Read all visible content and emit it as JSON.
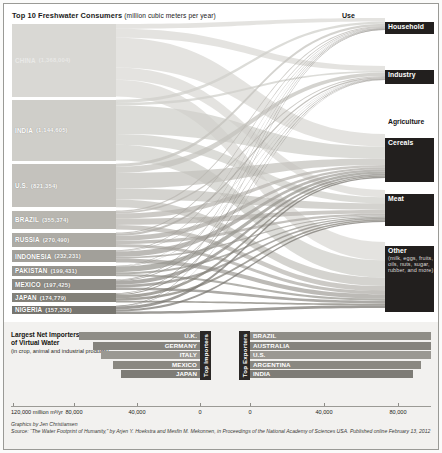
{
  "sankey": {
    "title": "Top 10 Freshwater Consumers",
    "title_units": "(million cubic meters per year)",
    "use_header": "Use",
    "countries": [
      {
        "name": "CHINA",
        "value": "(1,368,004)",
        "amount": 1368004
      },
      {
        "name": "INDIA",
        "value": "(1,144,605)",
        "amount": 1144605
      },
      {
        "name": "U.S.",
        "value": "(821,354)",
        "amount": 821354
      },
      {
        "name": "BRAZIL",
        "value": "(355,374)",
        "amount": 355374
      },
      {
        "name": "RUSSIA",
        "value": "(270,490)",
        "amount": 270490
      },
      {
        "name": "INDONESIA",
        "value": "(232,231)",
        "amount": 232231
      },
      {
        "name": "PAKISTAN",
        "value": "(199,431)",
        "amount": 199431
      },
      {
        "name": "MEXICO",
        "value": "(197,425)",
        "amount": 197425
      },
      {
        "name": "JAPAN",
        "value": "(174,779)",
        "amount": 174779
      },
      {
        "name": "NIGERIA",
        "value": "(157,336)",
        "amount": 157336
      }
    ],
    "uses": [
      {
        "name": "Household",
        "note": ""
      },
      {
        "name": "Industry",
        "note": ""
      },
      {
        "name": "Agriculture",
        "note": ""
      },
      {
        "name": "Cereals",
        "note": ""
      },
      {
        "name": "Meat",
        "note": ""
      },
      {
        "name": "Other",
        "note": "(milk, eggs, fruits, oils, nuts, sugar, rubber, and more)"
      }
    ]
  },
  "virtual_water": {
    "title": "Largest Net Importers and Exporters of Virtual Water",
    "subtitle": "(in crop, animal and industrial products)",
    "importers_label": "Top Importers",
    "exporters_label": "Top Exporters",
    "importers": [
      {
        "name": "U.K.",
        "value": 77000
      },
      {
        "name": "GERMANY",
        "value": 68000
      },
      {
        "name": "ITALY",
        "value": 63000
      },
      {
        "name": "MEXICO",
        "value": 55000
      },
      {
        "name": "JAPAN",
        "value": 50000
      }
    ],
    "exporters": [
      {
        "name": "BRAZIL",
        "value": 97000
      },
      {
        "name": "AUSTRALIA",
        "value": 90000
      },
      {
        "name": "U.S.",
        "value": 86000
      },
      {
        "name": "ARGENTINA",
        "value": 80000
      },
      {
        "name": "INDIA",
        "value": 76000
      }
    ],
    "axis_ticks": [
      {
        "label": "120,000 million m³/yr",
        "pos": 0
      },
      {
        "label": "80,000",
        "pos": 1
      },
      {
        "label": "40,000",
        "pos": 2
      },
      {
        "label": "0",
        "pos": 3
      },
      {
        "label": "0",
        "pos": 4
      },
      {
        "label": "40,000",
        "pos": 5
      },
      {
        "label": "80,000",
        "pos": 6
      }
    ]
  },
  "credits": {
    "line1": "Graphics by Jen Christiansen",
    "line2": "Source: “The Water Footprint of Humanity,” by Arjen Y. Hoekstra and Mesfin M. Mekonnen, in Proceedings of the National Academy of Sciences USA. Published online February 13, 2012"
  },
  "chart_data": {
    "type": "sankey",
    "title": "Top 10 Freshwater Consumers (million cubic meters per year)",
    "units": "million cubic meters per year",
    "nodes_left": [
      "CHINA",
      "INDIA",
      "U.S.",
      "BRAZIL",
      "RUSSIA",
      "INDONESIA",
      "PAKISTAN",
      "MEXICO",
      "JAPAN",
      "NIGERIA"
    ],
    "nodes_left_values": [
      1368004,
      1144605,
      821354,
      355374,
      270490,
      232231,
      199431,
      197425,
      174779,
      157336
    ],
    "nodes_right": [
      "Household",
      "Industry",
      "Agriculture",
      "Cereals",
      "Meat",
      "Other"
    ],
    "flows": [
      {
        "source": "CHINA",
        "target": "Household",
        "value": 90000
      },
      {
        "source": "CHINA",
        "target": "Industry",
        "value": 170000
      },
      {
        "source": "CHINA",
        "target": "Cereals",
        "value": 560000
      },
      {
        "source": "CHINA",
        "target": "Meat",
        "value": 230000
      },
      {
        "source": "CHINA",
        "target": "Other",
        "value": 318004
      },
      {
        "source": "INDIA",
        "target": "Household",
        "value": 60000
      },
      {
        "source": "INDIA",
        "target": "Industry",
        "value": 45000
      },
      {
        "source": "INDIA",
        "target": "Cereals",
        "value": 540000
      },
      {
        "source": "INDIA",
        "target": "Meat",
        "value": 200000
      },
      {
        "source": "INDIA",
        "target": "Other",
        "value": 299605
      },
      {
        "source": "U.S.",
        "target": "Household",
        "value": 55000
      },
      {
        "source": "U.S.",
        "target": "Industry",
        "value": 120000
      },
      {
        "source": "U.S.",
        "target": "Cereals",
        "value": 290000
      },
      {
        "source": "U.S.",
        "target": "Meat",
        "value": 210000
      },
      {
        "source": "U.S.",
        "target": "Other",
        "value": 146354
      },
      {
        "source": "BRAZIL",
        "target": "Household",
        "value": 25000
      },
      {
        "source": "BRAZIL",
        "target": "Industry",
        "value": 30000
      },
      {
        "source": "BRAZIL",
        "target": "Cereals",
        "value": 95000
      },
      {
        "source": "BRAZIL",
        "target": "Meat",
        "value": 120000
      },
      {
        "source": "BRAZIL",
        "target": "Other",
        "value": 85374
      },
      {
        "source": "RUSSIA",
        "target": "Household",
        "value": 20000
      },
      {
        "source": "RUSSIA",
        "target": "Industry",
        "value": 40000
      },
      {
        "source": "RUSSIA",
        "target": "Cereals",
        "value": 95000
      },
      {
        "source": "RUSSIA",
        "target": "Meat",
        "value": 60000
      },
      {
        "source": "RUSSIA",
        "target": "Other",
        "value": 55490
      },
      {
        "source": "INDONESIA",
        "target": "Household",
        "value": 14000
      },
      {
        "source": "INDONESIA",
        "target": "Industry",
        "value": 12000
      },
      {
        "source": "INDONESIA",
        "target": "Cereals",
        "value": 100000
      },
      {
        "source": "INDONESIA",
        "target": "Meat",
        "value": 30000
      },
      {
        "source": "INDONESIA",
        "target": "Other",
        "value": 76231
      },
      {
        "source": "PAKISTAN",
        "target": "Household",
        "value": 10000
      },
      {
        "source": "PAKISTAN",
        "target": "Industry",
        "value": 8000
      },
      {
        "source": "PAKISTAN",
        "target": "Cereals",
        "value": 105000
      },
      {
        "source": "PAKISTAN",
        "target": "Meat",
        "value": 40000
      },
      {
        "source": "PAKISTAN",
        "target": "Other",
        "value": 36431
      },
      {
        "source": "MEXICO",
        "target": "Household",
        "value": 12000
      },
      {
        "source": "MEXICO",
        "target": "Industry",
        "value": 14000
      },
      {
        "source": "MEXICO",
        "target": "Cereals",
        "value": 70000
      },
      {
        "source": "MEXICO",
        "target": "Meat",
        "value": 55000
      },
      {
        "source": "MEXICO",
        "target": "Other",
        "value": 46425
      },
      {
        "source": "JAPAN",
        "target": "Household",
        "value": 14000
      },
      {
        "source": "JAPAN",
        "target": "Industry",
        "value": 22000
      },
      {
        "source": "JAPAN",
        "target": "Cereals",
        "value": 60000
      },
      {
        "source": "JAPAN",
        "target": "Meat",
        "value": 45000
      },
      {
        "source": "JAPAN",
        "target": "Other",
        "value": 33779
      },
      {
        "source": "NIGERIA",
        "target": "Household",
        "value": 10000
      },
      {
        "source": "NIGERIA",
        "target": "Industry",
        "value": 6000
      },
      {
        "source": "NIGERIA",
        "target": "Cereals",
        "value": 55000
      },
      {
        "source": "NIGERIA",
        "target": "Meat",
        "value": 40000
      },
      {
        "source": "NIGERIA",
        "target": "Other",
        "value": 46336
      }
    ]
  },
  "chart_data_2": {
    "type": "bar",
    "orientation": "horizontal-diverging",
    "title": "Largest Net Importers and Exporters of Virtual Water",
    "xlabel": "million m³/yr",
    "xlim": [
      0,
      120000
    ],
    "series": [
      {
        "name": "Top Importers",
        "categories": [
          "U.K.",
          "GERMANY",
          "ITALY",
          "MEXICO",
          "JAPAN"
        ],
        "values": [
          77000,
          68000,
          63000,
          55000,
          50000
        ]
      },
      {
        "name": "Top Exporters",
        "categories": [
          "BRAZIL",
          "AUSTRALIA",
          "U.S.",
          "ARGENTINA",
          "INDIA"
        ],
        "values": [
          97000,
          90000,
          86000,
          80000,
          76000
        ]
      }
    ]
  }
}
